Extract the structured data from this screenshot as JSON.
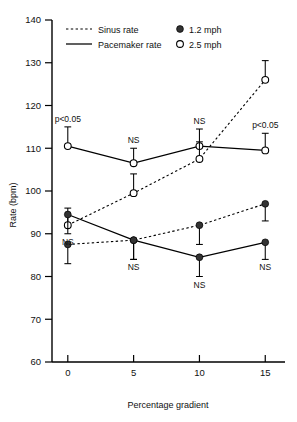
{
  "chart_data": {
    "type": "line",
    "title": "",
    "xlabel": "Percentage gradient",
    "ylabel": "Rate (bpm)",
    "x": [
      0,
      5,
      10,
      15
    ],
    "xtick_labels": [
      "0",
      "5",
      "10",
      "15"
    ],
    "xlim": [
      -1.2,
      16.5
    ],
    "ylim": [
      60,
      140
    ],
    "ytick_labels": [
      "60",
      "70",
      "80",
      "90",
      "100",
      "110",
      "120",
      "130",
      "140"
    ],
    "yticks": [
      60,
      70,
      80,
      90,
      100,
      110,
      120,
      130,
      140
    ],
    "grid": false,
    "legend_position": "top",
    "series": [
      {
        "name": "Pacemaker rate 2.5 mph",
        "line_style": "solid",
        "marker": "open-circle",
        "values": [
          110.5,
          106.5,
          110.5,
          109.5
        ],
        "errors": [
          4.5,
          3.5,
          4.0,
          4.0
        ],
        "error_direction": "up",
        "annotations": [
          "p<0.05",
          "NS",
          "NS",
          "p<0.05"
        ]
      },
      {
        "name": "Sinus rate 2.5 mph",
        "line_style": "dashed",
        "marker": "open-circle",
        "values": [
          92.0,
          99.5,
          107.5,
          126.0
        ],
        "errors": [
          4.0,
          4.5,
          4.0,
          4.5
        ],
        "error_direction": "up",
        "annotations": [
          "",
          "",
          "",
          ""
        ]
      },
      {
        "name": "Pacemaker rate 1.2 mph",
        "line_style": "solid",
        "marker": "filled-circle",
        "values": [
          94.5,
          88.5,
          84.5,
          88.0
        ],
        "errors": [
          4.5,
          4.5,
          4.5,
          4.0
        ],
        "error_direction": "down",
        "annotations": [
          "NS",
          "NS",
          "NS",
          "NS"
        ]
      },
      {
        "name": "Sinus rate 1.2 mph",
        "line_style": "dashed",
        "marker": "filled-circle",
        "values": [
          87.5,
          88.5,
          92.0,
          97.0
        ],
        "errors": [
          4.5,
          4.5,
          4.5,
          4.0
        ],
        "error_direction": "down",
        "annotations": [
          "",
          "",
          "",
          ""
        ]
      }
    ],
    "legend": {
      "style_entries": [
        {
          "label": "Sinus rate",
          "style": "dashed"
        },
        {
          "label": "Pacemaker rate",
          "style": "solid"
        }
      ],
      "marker_entries": [
        {
          "label": "1.2 mph",
          "marker": "filled-circle"
        },
        {
          "label": "2.5 mph",
          "marker": "open-circle"
        }
      ]
    },
    "significance_labels": {
      "upper": [
        "p<0.05",
        "NS",
        "NS",
        "p<0.05"
      ],
      "lower": [
        "NS",
        "NS",
        "NS",
        "NS"
      ]
    },
    "colors": {
      "axis": "#000000",
      "line": "#000000",
      "marker_filled": "#333333",
      "marker_open": "#ffffff",
      "background": "#ffffff"
    }
  }
}
